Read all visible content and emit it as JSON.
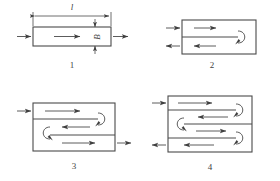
{
  "figure": {
    "line_color": "#4a4a4a",
    "text_color": "#3f3f3f",
    "background_color": "#ffffff"
  },
  "dimensions": {
    "length_label": "l",
    "width_label": "B"
  },
  "cases": [
    {
      "id": "case-1",
      "number": "1",
      "passes": 1,
      "baffles": 0,
      "inlet_side": "left",
      "outlet_side": "right",
      "description": "Single pass straight-through flow with length l and width B dimensioned"
    },
    {
      "id": "case-2",
      "number": "2",
      "passes": 2,
      "baffles": 1,
      "inlet_side": "left-top",
      "outlet_side": "left-bottom",
      "description": "Two pass flow with one longitudinal baffle and a single U-turn at the right end"
    },
    {
      "id": "case-3",
      "number": "3",
      "passes": 3,
      "baffles": 2,
      "inlet_side": "left-top",
      "outlet_side": "right-bottom",
      "description": "Three pass serpentine flow with two longitudinal baffles"
    },
    {
      "id": "case-4",
      "number": "4",
      "passes": 4,
      "baffles": 3,
      "inlet_side": "left-top",
      "outlet_side": "left-bottom",
      "description": "Four pass serpentine flow with three longitudinal baffles"
    }
  ]
}
